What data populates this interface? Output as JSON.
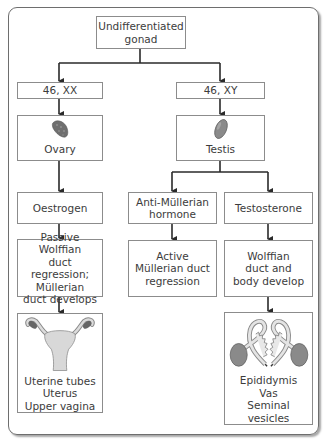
{
  "diagram": {
    "root": {
      "label": "Undifferentiated\ngonad"
    },
    "female": {
      "karyotype": "46, XX",
      "gonad": {
        "label": "Ovary",
        "icon": "ovary-icon"
      },
      "hormone": "Oestrogen",
      "effect": "Passive Wolffian\nduct regression;\nMüllerian\nduct develops",
      "structures": {
        "label": "Uterine tubes\nUterus\nUpper vagina",
        "icon": "uterus-illustration"
      }
    },
    "male": {
      "karyotype": "46, XY",
      "gonad": {
        "label": "Testis",
        "icon": "testis-icon"
      },
      "hormones": [
        {
          "label": "Anti-Müllerian\nhormone",
          "effect": "Active\nMüllerian duct\nregression"
        },
        {
          "label": "Testosterone",
          "effect": "Wolffian\nduct and\nbody develop"
        }
      ],
      "structures": {
        "label": "Epididymis\nVas\nSeminal vesicles",
        "icon": "male-ducts-illustration"
      }
    },
    "colors": {
      "line": "#2a2a2a",
      "box_border": "#8c8c8c",
      "organ_fill": "#8a8a8a"
    }
  }
}
